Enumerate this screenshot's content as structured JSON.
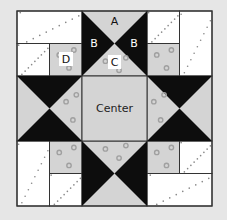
{
  "diagram": {
    "colors": {
      "background": "#e6e6e6",
      "light_gray": "#d4d4d4",
      "black": "#0d0d0d",
      "white": "#ffffff",
      "outline": "#333333",
      "dot": "#a0a0a0"
    },
    "labels": {
      "A": "A",
      "B_left": "B",
      "B_right": "B",
      "C": "C",
      "D": "D",
      "center": "Center"
    }
  }
}
